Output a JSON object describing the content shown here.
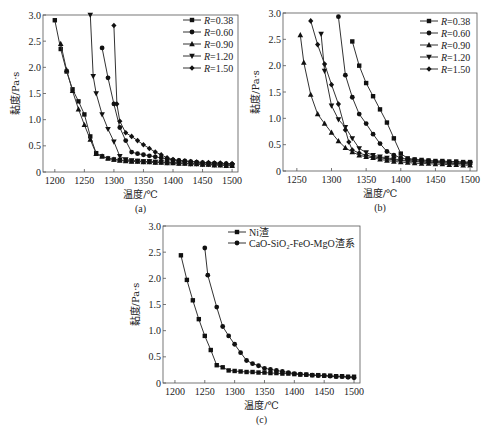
{
  "chart_data": [
    {
      "id": "a",
      "type": "line",
      "caption": "(a)",
      "xlabel": "温度/℃",
      "ylabel": "黏度/Pa·s",
      "xlim": [
        1180,
        1510
      ],
      "ylim": [
        0,
        3.0
      ],
      "xticks": [
        1200,
        1250,
        1300,
        1350,
        1400,
        1450,
        1500
      ],
      "yticks": [
        0,
        0.5,
        1.0,
        1.5,
        2.0,
        2.5,
        3.0
      ],
      "ytick_labels": [
        "0",
        "0.5",
        "1.0",
        "1.5",
        "2.0",
        "2.5",
        "3.0"
      ],
      "legend_position": "top-right",
      "series": [
        {
          "name": "R=0.38",
          "marker": "square",
          "x": [
            1200,
            1210,
            1220,
            1230,
            1240,
            1250,
            1260,
            1270,
            1280,
            1290,
            1300,
            1310,
            1320,
            1330,
            1340,
            1350,
            1360,
            1370,
            1380,
            1390,
            1400,
            1410,
            1420,
            1430,
            1440,
            1450,
            1460,
            1470,
            1480,
            1490,
            1500
          ],
          "y": [
            2.9,
            2.35,
            1.92,
            1.58,
            1.35,
            1.1,
            0.68,
            0.36,
            0.3,
            0.26,
            0.24,
            0.23,
            0.22,
            0.21,
            0.21,
            0.2,
            0.2,
            0.19,
            0.19,
            0.18,
            0.18,
            0.17,
            0.17,
            0.16,
            0.16,
            0.15,
            0.15,
            0.14,
            0.14,
            0.13,
            0.13
          ]
        },
        {
          "name": "R=0.60",
          "marker": "circle",
          "x": [
            1280,
            1290,
            1300,
            1310,
            1320,
            1330,
            1340,
            1350,
            1360,
            1370,
            1380,
            1390,
            1400,
            1410,
            1420,
            1430,
            1440,
            1450,
            1460,
            1470,
            1480,
            1490,
            1500
          ],
          "y": [
            2.37,
            1.8,
            1.3,
            0.85,
            0.6,
            0.38,
            0.35,
            0.33,
            0.31,
            0.29,
            0.27,
            0.25,
            0.23,
            0.22,
            0.21,
            0.2,
            0.19,
            0.18,
            0.17,
            0.17,
            0.16,
            0.16,
            0.15
          ]
        },
        {
          "name": "R=0.90",
          "marker": "triangle-up",
          "x": [
            1210,
            1220,
            1230,
            1240,
            1250,
            1260,
            1270,
            1280,
            1290,
            1300,
            1310,
            1320,
            1330,
            1340,
            1350,
            1360,
            1370,
            1380,
            1390,
            1400,
            1410,
            1420,
            1430,
            1440,
            1450,
            1460,
            1470,
            1480,
            1490,
            1500
          ],
          "y": [
            2.45,
            1.95,
            1.55,
            1.2,
            0.9,
            0.62,
            0.35,
            0.3,
            0.26,
            0.24,
            0.22,
            0.21,
            0.2,
            0.2,
            0.19,
            0.19,
            0.18,
            0.18,
            0.17,
            0.17,
            0.16,
            0.16,
            0.15,
            0.15,
            0.14,
            0.14,
            0.13,
            0.13,
            0.12,
            0.12
          ]
        },
        {
          "name": "R=1.20",
          "marker": "triangle-down",
          "x": [
            1260,
            1265,
            1270,
            1280,
            1290,
            1300,
            1310,
            1320,
            1330,
            1340,
            1350,
            1360,
            1370,
            1380,
            1390,
            1400,
            1410,
            1420,
            1430,
            1440,
            1450,
            1460,
            1470,
            1480,
            1490,
            1500
          ],
          "y": [
            3.0,
            1.83,
            1.5,
            1.1,
            0.82,
            0.58,
            0.3,
            0.24,
            0.22,
            0.21,
            0.2,
            0.2,
            0.19,
            0.19,
            0.18,
            0.18,
            0.17,
            0.17,
            0.16,
            0.16,
            0.15,
            0.15,
            0.14,
            0.14,
            0.13,
            0.13
          ]
        },
        {
          "name": "R=1.50",
          "marker": "diamond",
          "x": [
            1300,
            1305,
            1310,
            1320,
            1330,
            1340,
            1350,
            1360,
            1370,
            1380,
            1390,
            1400,
            1410,
            1420,
            1430,
            1440,
            1450,
            1460,
            1470,
            1480,
            1490,
            1500
          ],
          "y": [
            2.8,
            1.3,
            0.97,
            0.75,
            0.68,
            0.6,
            0.52,
            0.45,
            0.38,
            0.33,
            0.27,
            0.24,
            0.22,
            0.21,
            0.2,
            0.19,
            0.18,
            0.18,
            0.17,
            0.17,
            0.16,
            0.16
          ]
        }
      ]
    },
    {
      "id": "b",
      "type": "line",
      "caption": "(b)",
      "xlabel": "温度/℃",
      "ylabel": "黏度/Pa·s",
      "xlim": [
        1230,
        1510
      ],
      "ylim": [
        0,
        3.0
      ],
      "xticks": [
        1250,
        1300,
        1350,
        1400,
        1450,
        1500
      ],
      "yticks": [
        0,
        0.5,
        1.0,
        1.5,
        2.0,
        2.5,
        3.0
      ],
      "ytick_labels": [
        "0",
        "0.5",
        "1.0",
        "1.5",
        "2.0",
        "2.5",
        "3.0"
      ],
      "legend_position": "top-right",
      "series": [
        {
          "name": "R=0.38",
          "marker": "square",
          "x": [
            1330,
            1340,
            1350,
            1360,
            1370,
            1380,
            1390,
            1400,
            1410,
            1420,
            1430,
            1440,
            1450,
            1460,
            1470,
            1480,
            1490,
            1500
          ],
          "y": [
            2.46,
            2.0,
            1.67,
            1.42,
            1.17,
            0.92,
            0.62,
            0.33,
            0.24,
            0.22,
            0.21,
            0.2,
            0.19,
            0.19,
            0.18,
            0.18,
            0.17,
            0.17
          ]
        },
        {
          "name": "R=0.60",
          "marker": "circle",
          "x": [
            1310,
            1320,
            1330,
            1340,
            1350,
            1360,
            1370,
            1380,
            1390,
            1400,
            1410,
            1420,
            1430,
            1440,
            1450,
            1460,
            1470,
            1480,
            1490,
            1500
          ],
          "y": [
            2.93,
            1.82,
            1.4,
            1.08,
            0.9,
            0.7,
            0.52,
            0.37,
            0.3,
            0.25,
            0.22,
            0.21,
            0.2,
            0.19,
            0.18,
            0.18,
            0.17,
            0.17,
            0.16,
            0.16
          ]
        },
        {
          "name": "R=0.90",
          "marker": "triangle-up",
          "x": [
            1255,
            1260,
            1270,
            1280,
            1290,
            1300,
            1310,
            1320,
            1330,
            1340,
            1350,
            1360,
            1370,
            1380,
            1390,
            1400,
            1410,
            1420,
            1430,
            1440,
            1450,
            1460,
            1470,
            1480,
            1490,
            1500
          ],
          "y": [
            2.58,
            2.06,
            1.45,
            1.08,
            0.9,
            0.73,
            0.57,
            0.44,
            0.36,
            0.3,
            0.27,
            0.25,
            0.22,
            0.2,
            0.18,
            0.17,
            0.16,
            0.15,
            0.14,
            0.14,
            0.13,
            0.13,
            0.12,
            0.12,
            0.11,
            0.11
          ]
        },
        {
          "name": "R=1.20",
          "marker": "triangle-down",
          "x": [
            1285,
            1290,
            1300,
            1310,
            1320,
            1330,
            1340,
            1350,
            1360,
            1370,
            1380,
            1390,
            1400,
            1410,
            1420,
            1430,
            1440,
            1450,
            1460,
            1470,
            1480,
            1490,
            1500
          ],
          "y": [
            2.6,
            1.9,
            1.24,
            0.98,
            0.83,
            0.62,
            0.43,
            0.35,
            0.3,
            0.27,
            0.25,
            0.23,
            0.21,
            0.2,
            0.19,
            0.18,
            0.17,
            0.16,
            0.16,
            0.15,
            0.15,
            0.14,
            0.14
          ]
        },
        {
          "name": "R=1.50",
          "marker": "diamond",
          "x": [
            1270,
            1280,
            1290,
            1300,
            1310,
            1320,
            1325,
            1330,
            1340,
            1350,
            1360,
            1370,
            1380,
            1390,
            1400,
            1410,
            1420,
            1430,
            1440,
            1450,
            1460,
            1470,
            1480,
            1490,
            1500
          ],
          "y": [
            2.85,
            2.4,
            2.03,
            1.64,
            1.27,
            0.78,
            0.55,
            0.4,
            0.34,
            0.3,
            0.27,
            0.25,
            0.23,
            0.21,
            0.2,
            0.19,
            0.18,
            0.17,
            0.16,
            0.16,
            0.15,
            0.15,
            0.14,
            0.14,
            0.13
          ]
        }
      ]
    },
    {
      "id": "c",
      "type": "line",
      "caption": "(c)",
      "xlabel": "温度/℃",
      "ylabel": "黏度/Pa·s",
      "xlim": [
        1180,
        1510
      ],
      "ylim": [
        0,
        3.0
      ],
      "xticks": [
        1200,
        1250,
        1300,
        1350,
        1400,
        1450,
        1500
      ],
      "yticks": [
        0,
        0.5,
        1.0,
        1.5,
        2.0,
        2.5,
        3.0
      ],
      "ytick_labels": [
        "0",
        "0.5",
        "1.0",
        "1.5",
        "2.0",
        "2.5",
        "3.0"
      ],
      "legend_position": "top",
      "series": [
        {
          "name": "Ni渣",
          "marker": "square",
          "x": [
            1210,
            1220,
            1230,
            1240,
            1250,
            1260,
            1270,
            1280,
            1290,
            1300,
            1310,
            1320,
            1330,
            1340,
            1350,
            1360,
            1370,
            1380,
            1390,
            1400,
            1410,
            1420,
            1430,
            1440,
            1450,
            1460,
            1470,
            1480,
            1490,
            1500
          ],
          "y": [
            2.44,
            1.97,
            1.58,
            1.22,
            0.9,
            0.63,
            0.34,
            0.3,
            0.24,
            0.23,
            0.22,
            0.21,
            0.21,
            0.2,
            0.2,
            0.19,
            0.19,
            0.18,
            0.18,
            0.17,
            0.16,
            0.16,
            0.15,
            0.15,
            0.14,
            0.14,
            0.13,
            0.13,
            0.12,
            0.12
          ]
        },
        {
          "name": "CaO-SiO₂-FeO-MgO渣系",
          "marker": "circle",
          "x": [
            1250,
            1255,
            1270,
            1280,
            1290,
            1300,
            1310,
            1320,
            1330,
            1340,
            1350,
            1360,
            1370,
            1380,
            1390,
            1400,
            1410,
            1420,
            1430,
            1440,
            1450,
            1460,
            1470,
            1480,
            1490,
            1500
          ],
          "y": [
            2.58,
            2.06,
            1.45,
            1.08,
            0.9,
            0.74,
            0.58,
            0.43,
            0.37,
            0.33,
            0.28,
            0.26,
            0.24,
            0.22,
            0.2,
            0.18,
            0.17,
            0.16,
            0.15,
            0.14,
            0.14,
            0.13,
            0.12,
            0.12,
            0.11,
            0.1
          ]
        }
      ]
    }
  ]
}
